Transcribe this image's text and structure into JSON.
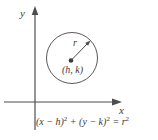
{
  "figure": {
    "colors": {
      "background": "#ffffff",
      "stroke": "#4d4d4d",
      "circle_stroke": "#5a5a5a",
      "text": "#3a3a3a"
    },
    "axes": {
      "x_label": "x",
      "y_label": "y"
    },
    "circle": {
      "center_label": "(h, k)",
      "radius_label": "r"
    },
    "equation": {
      "term1": "(x − h)",
      "sup1": "2",
      "term2": " + (y − k)",
      "sup2": "2",
      "term3": " = r",
      "sup3": "2"
    }
  }
}
